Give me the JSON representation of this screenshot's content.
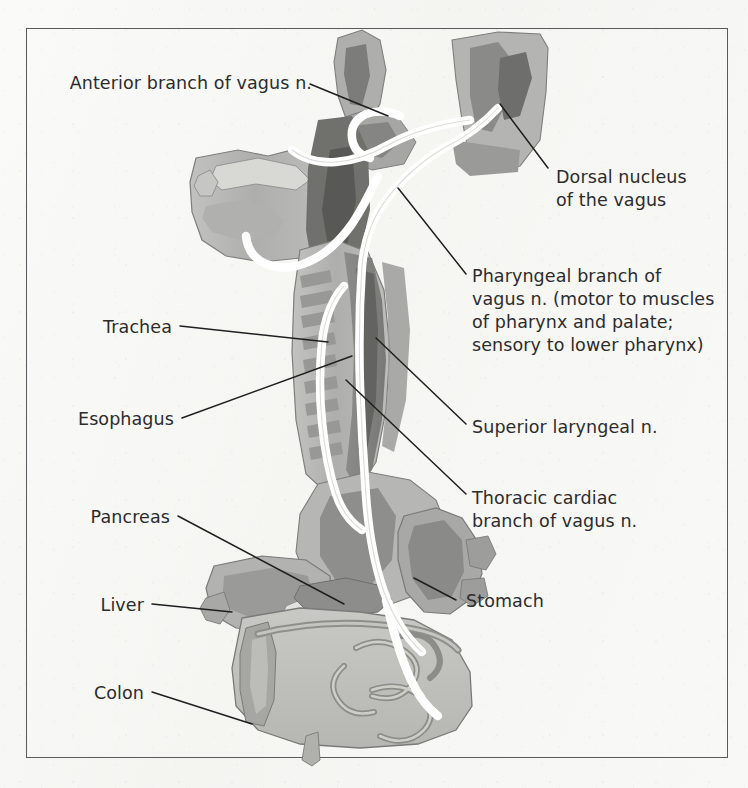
{
  "figure": {
    "frame_color": "#5a5a5c",
    "page_background": "#f7f7f5",
    "nerve_color": "#ffffff",
    "tissue_colors": [
      "#b9b9b9",
      "#a3a3a3",
      "#8d8d8d",
      "#6f6f6f",
      "#c9c9c9",
      "#d6d6d2"
    ]
  },
  "labels": {
    "anterior_branch": "Anterior branch of vagus n.",
    "dorsal_nucleus_line1": "Dorsal nucleus",
    "dorsal_nucleus_line2": "of the vagus",
    "pharyngeal_line1": "Pharyngeal branch of",
    "pharyngeal_line2": "vagus n. (motor to muscles",
    "pharyngeal_line3": "of pharynx and palate;",
    "pharyngeal_line4": "sensory to lower pharynx)",
    "superior_laryngeal": "Superior laryngeal n.",
    "thoracic_cardiac_line1": "Thoracic cardiac",
    "thoracic_cardiac_line2": "branch of vagus n.",
    "trachea": "Trachea",
    "esophagus": "Esophagus",
    "pancreas": "Pancreas",
    "liver": "Liver",
    "colon": "Colon",
    "stomach": "Stomach"
  },
  "structures": [
    {
      "name": "brainstem-medulla",
      "side": "upper"
    },
    {
      "name": "nasal-oral-cavity",
      "side": "upper-left"
    },
    {
      "name": "cerebellum-occipital",
      "side": "upper-right"
    },
    {
      "name": "tongue",
      "side": "upper-left"
    },
    {
      "name": "trachea",
      "side": "middle-left"
    },
    {
      "name": "esophagus",
      "side": "middle"
    },
    {
      "name": "stomach",
      "side": "lower-right"
    },
    {
      "name": "liver",
      "side": "lower-left"
    },
    {
      "name": "pancreas",
      "side": "lower-middle"
    },
    {
      "name": "colon",
      "side": "lower"
    },
    {
      "name": "small-intestine",
      "side": "lower-right"
    }
  ],
  "nerve_branches": [
    "anterior branch of vagus n.",
    "dorsal nucleus of the vagus",
    "pharyngeal branch of vagus n.",
    "superior laryngeal n.",
    "thoracic cardiac branch of vagus n."
  ]
}
